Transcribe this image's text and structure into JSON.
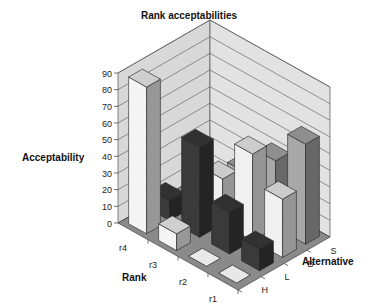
{
  "chart_data": {
    "type": "bar",
    "subtype": "3d-column",
    "title": "Rank acceptabilities",
    "ylabel": "Acceptability",
    "xlabel": "Rank",
    "zlabel": "Alternative",
    "ylim": [
      0,
      90
    ],
    "yticks": [
      0,
      10,
      20,
      30,
      40,
      50,
      60,
      70,
      80,
      90
    ],
    "categories": [
      "r4",
      "r3",
      "r2",
      "r1"
    ],
    "series": [
      {
        "name": "H",
        "color": "#f4f4f4",
        "values": [
          88,
          10,
          0,
          0
        ]
      },
      {
        "name": "L",
        "color": "#3a3a3a",
        "values": [
          12,
          54,
          25,
          13
        ]
      },
      {
        "name": "B",
        "color": "#f0f0f0",
        "values": [
          0,
          27,
          52,
          35
        ]
      },
      {
        "name": "S",
        "color": "#a8a8a8",
        "values": [
          0,
          23,
          40,
          60
        ]
      }
    ],
    "grid": true,
    "legend": "none"
  }
}
